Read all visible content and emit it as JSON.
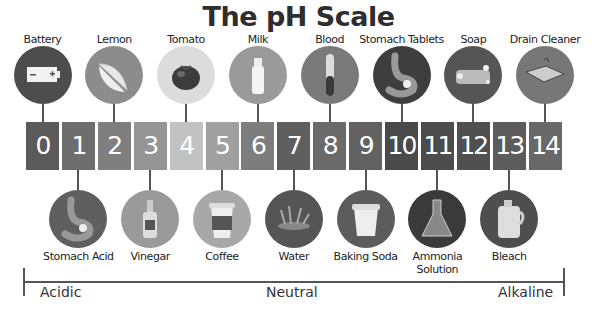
{
  "title": "The pH Scale",
  "scale": {
    "values": [
      "0",
      "1",
      "2",
      "3",
      "4",
      "5",
      "6",
      "7",
      "8",
      "9",
      "10",
      "11",
      "12",
      "13",
      "14"
    ],
    "colors": [
      "#5a5a5a",
      "#6e6e6e",
      "#7f7f7f",
      "#959595",
      "#c2c2c2",
      "#a0a0a0",
      "#7d7d7d",
      "#5f5f5f",
      "#6a6a6a",
      "#626262",
      "#4a4a4a",
      "#4c4c4c",
      "#505050",
      "#5c5c5c",
      "#686868"
    ]
  },
  "top_items": [
    {
      "ph": 0,
      "label": "Battery",
      "icon": "battery-icon",
      "circle_color": "#4d4d4d"
    },
    {
      "ph": 2,
      "label": "Lemon",
      "icon": "lemon-icon",
      "circle_color": "#8c8c8c"
    },
    {
      "ph": 4,
      "label": "Tomato",
      "icon": "tomato-icon",
      "circle_color": "#dcdcdc"
    },
    {
      "ph": 6,
      "label": "Milk",
      "icon": "milk-bottle-icon",
      "circle_color": "#9a9a9a"
    },
    {
      "ph": 8,
      "label": "Blood",
      "icon": "test-tube-icon",
      "circle_color": "#7a7a7a"
    },
    {
      "ph": 10,
      "label": "Stomach Tablets",
      "icon": "stomach-icon",
      "circle_color": "#3e3e3e"
    },
    {
      "ph": 12,
      "label": "Soap",
      "icon": "soap-icon",
      "circle_color": "#555555"
    },
    {
      "ph": 14,
      "label": "Drain Cleaner",
      "icon": "sink-icon",
      "circle_color": "#777777"
    }
  ],
  "bottom_items": [
    {
      "ph": 1,
      "label": "Stomach Acid",
      "icon": "stomach-icon",
      "circle_color": "#5f5f5f"
    },
    {
      "ph": 3,
      "label": "Vinegar",
      "icon": "vinegar-bottle-icon",
      "circle_color": "#9a9a9a"
    },
    {
      "ph": 5,
      "label": "Coffee",
      "icon": "coffee-cup-icon",
      "circle_color": "#a8a8a8"
    },
    {
      "ph": 7,
      "label": "Water",
      "icon": "water-splash-icon",
      "circle_color": "#555555"
    },
    {
      "ph": 9,
      "label": "Baking Soda",
      "icon": "baking-soda-tub-icon",
      "circle_color": "#5c5c5c"
    },
    {
      "ph": 11,
      "label": "Ammonia",
      "label2": "Solution",
      "icon": "flask-icon",
      "circle_color": "#3a3a3a"
    },
    {
      "ph": 13,
      "label": "Bleach",
      "icon": "bleach-jug-icon",
      "circle_color": "#4e4e4e"
    }
  ],
  "axis": {
    "left": "Acidic",
    "center": "Neutral",
    "right": "Alkaline"
  }
}
